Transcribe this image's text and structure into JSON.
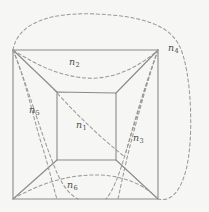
{
  "figure": {
    "background_color": "#f6f6f4",
    "solid_line_color": "#8a8a8a",
    "dashed_line_color": "#9a9a9a",
    "label_color": "#4c4c4c",
    "width": 209,
    "height": 212
  },
  "graph": {
    "description": "Nested-square drawing of the 3-cube: an outer square, an inner square, and four diagonal connecting edges.",
    "outer_square": {
      "name": "outer-square",
      "corners": [
        {
          "name": "outer-top-left",
          "x": 13,
          "y": 50
        },
        {
          "name": "outer-top-right",
          "x": 158,
          "y": 50
        },
        {
          "name": "outer-bottom-right",
          "x": 158,
          "y": 199
        },
        {
          "name": "outer-bottom-left",
          "x": 13,
          "y": 199
        }
      ]
    },
    "inner_square": {
      "name": "inner-square",
      "corners": [
        {
          "name": "inner-top-left",
          "x": 57,
          "y": 92
        },
        {
          "name": "inner-top-right",
          "x": 116,
          "y": 93
        },
        {
          "name": "inner-bottom-right",
          "x": 116,
          "y": 160
        },
        {
          "name": "inner-bottom-left",
          "x": 57,
          "y": 160
        }
      ]
    },
    "connecting_edges": [
      {
        "name": "edge-top-left",
        "from": "outer-top-left",
        "to": "inner-top-left"
      },
      {
        "name": "edge-top-right",
        "from": "outer-top-right",
        "to": "inner-top-right"
      },
      {
        "name": "edge-bottom-right",
        "from": "outer-bottom-right",
        "to": "inner-bottom-right"
      },
      {
        "name": "edge-bottom-left",
        "from": "outer-bottom-left",
        "to": "inner-bottom-left"
      }
    ]
  },
  "regions": [
    {
      "id": "n1",
      "label": "n",
      "subscript": "1",
      "label_x": 76,
      "label_y": 120,
      "meaning": "inner face"
    },
    {
      "id": "n2",
      "label": "n",
      "subscript": "2",
      "label_x": 69,
      "label_y": 57,
      "meaning": "top face"
    },
    {
      "id": "n3",
      "label": "n",
      "subscript": "3",
      "label_x": 133,
      "label_y": 133,
      "meaning": "right face"
    },
    {
      "id": "n4",
      "label": "n",
      "subscript": "4",
      "label_x": 168,
      "label_y": 43,
      "meaning": "outer face"
    },
    {
      "id": "n5",
      "label": "n",
      "subscript": "5",
      "label_x": 29,
      "label_y": 105,
      "meaning": "left face"
    },
    {
      "id": "n6",
      "label": "n",
      "subscript": "6",
      "label_x": 67,
      "label_y": 180,
      "meaning": "bottom face"
    }
  ]
}
